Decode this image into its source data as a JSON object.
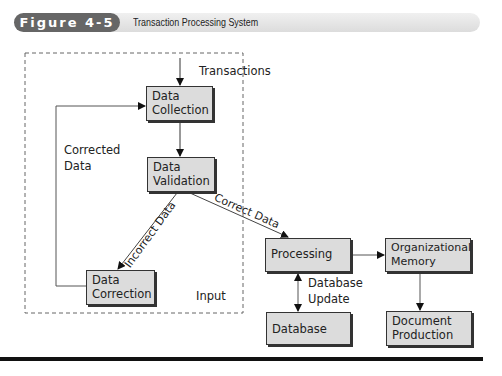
{
  "header": {
    "figure_label": "Figure 4-5",
    "title": "Transaction Processing System"
  },
  "nodes": {
    "data_collection": "Data\nCollection",
    "data_validation": "Data\nValidation",
    "data_correction": "Data\nCorrection",
    "processing": "Processing",
    "organizational_memory": "Organizational\nMemory",
    "database": "Database",
    "document_production": "Document\nProduction"
  },
  "labels": {
    "transactions": "Transactions",
    "corrected_data_1": "Corrected",
    "corrected_data_2": "Data",
    "incorrect_data": "Incorrect Data",
    "correct_data": "Correct Data",
    "input": "Input",
    "database_update_1": "Database",
    "database_update_2": "Update"
  },
  "colors": {
    "node_fill": "#dcdcdc",
    "pill": "#666666",
    "line": "#333333"
  }
}
